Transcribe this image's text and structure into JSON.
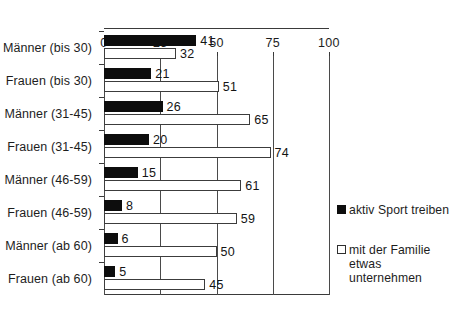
{
  "chart_data": {
    "type": "bar",
    "orientation": "horizontal",
    "title": "",
    "subtitle": "",
    "xlabel": "",
    "ylabel": "",
    "xlim": [
      0,
      100
    ],
    "xticks": [
      0,
      25,
      50,
      75,
      100
    ],
    "xtick_labels": [
      "0",
      "25",
      "50",
      "75",
      "100"
    ],
    "grid": true,
    "grid_axis": "x",
    "legend_position": "right",
    "categories": [
      "Männer (bis 30)",
      "Frauen (bis 30)",
      "Männer (31-45)",
      "Frauen (31-45)",
      "Männer (46-59)",
      "Frauen (46-59)",
      "Männer (ab 60)",
      "Frauen (ab 60)"
    ],
    "series": [
      {
        "name": "aktiv Sport treiben",
        "color": "#0d0d0d",
        "values": [
          41,
          21,
          26,
          20,
          15,
          8,
          6,
          5
        ]
      },
      {
        "name": "mit der Familie etwas unternehmen",
        "color": "#ffffff",
        "values": [
          32,
          51,
          65,
          74,
          61,
          59,
          50,
          45
        ]
      }
    ]
  },
  "legend": {
    "entries": [
      {
        "label": "aktiv Sport treiben",
        "swatch": "filled-black-square"
      },
      {
        "label": "mit der Familie\netwas unternehmen",
        "swatch": "outlined-white-square"
      }
    ]
  },
  "colors": {
    "series_dark": "#0d0d0d",
    "series_light": "#ffffff",
    "axis": "#3a3a3a",
    "text": "#1d1d1d",
    "background": "#ffffff"
  }
}
